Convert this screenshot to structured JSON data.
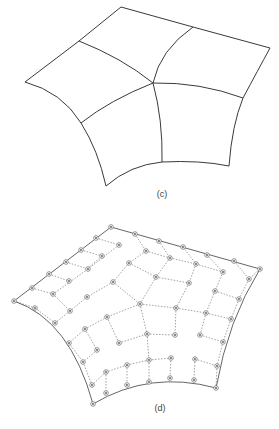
{
  "figures": [
    {
      "id": "c",
      "label": "(c)",
      "label_pos": [
        162,
        189
      ],
      "description": "Subdivision surface of four quadrilateral patches meeting at a central vertex",
      "patch_edges": [
        "M121 7 L193 27",
        "M193 27 L270 48",
        "M121 7 L79 41",
        "M79 41 L25 82",
        "M25 82 Q62 92 81 123",
        "M81 123 Q98 150 106 186",
        "M106 186 Q130 165 162 162",
        "M162 162 Q200 160 229 166",
        "M229 166 Q232 125 243 98",
        "M243 98 Q258 70 270 48",
        "M79 41 Q122 58 153 83",
        "M153 83 Q160 50 193 27",
        "M153 83 Q200 82 243 98",
        "M153 83 Q110 100 81 123",
        "M153 83 Q163 120 162 162"
      ]
    },
    {
      "id": "d",
      "label": "(d)",
      "label_pos": [
        160,
        403
      ],
      "description": "Control net with dotted edges and circular control points",
      "boundary_curves": [
        "M111 227 L260 269",
        "M111 227 L14 301",
        "M14 301 Q70 320 93 404",
        "M93 404 Q150 370 216 388",
        "M216 388 Q228 320 260 269"
      ],
      "net_edges": [
        [
          [
            96,
            238
          ],
          [
            119,
            245
          ]
        ],
        [
          [
            81,
            250
          ],
          [
            102,
            256
          ]
        ],
        [
          [
            66,
            262
          ],
          [
            88,
            269
          ]
        ],
        [
          [
            49,
            274
          ],
          [
            69,
            281
          ]
        ],
        [
          [
            32,
            288
          ],
          [
            53,
            294
          ]
        ],
        [
          [
            14,
            301
          ],
          [
            35,
            308
          ]
        ],
        [
          [
            135,
            234
          ],
          [
            146,
            251
          ]
        ],
        [
          [
            159,
            241
          ],
          [
            170,
            258
          ]
        ],
        [
          [
            183,
            247
          ],
          [
            196,
            264
          ]
        ],
        [
          [
            207,
            255
          ],
          [
            223,
            272
          ]
        ],
        [
          [
            234,
            261
          ],
          [
            249,
            279
          ]
        ],
        [
          [
            260,
            269
          ],
          [
            249,
            279
          ]
        ],
        [
          [
            119,
            245
          ],
          [
            88,
            269
          ]
        ],
        [
          [
            88,
            269
          ],
          [
            53,
            294
          ]
        ],
        [
          [
            146,
            251
          ],
          [
            129,
            263
          ]
        ],
        [
          [
            102,
            256
          ],
          [
            88,
            268
          ]
        ],
        [
          [
            129,
            263
          ],
          [
            113,
            282
          ]
        ],
        [
          [
            113,
            282
          ],
          [
            87,
            297
          ]
        ],
        [
          [
            87,
            297
          ],
          [
            70,
            311
          ]
        ],
        [
          [
            146,
            251
          ],
          [
            170,
            258
          ]
        ],
        [
          [
            170,
            258
          ],
          [
            196,
            264
          ]
        ],
        [
          [
            196,
            264
          ],
          [
            223,
            272
          ]
        ],
        [
          [
            129,
            263
          ],
          [
            156,
            277
          ]
        ],
        [
          [
            156,
            277
          ],
          [
            189,
            283
          ]
        ],
        [
          [
            170,
            258
          ],
          [
            156,
            277
          ]
        ],
        [
          [
            196,
            264
          ],
          [
            189,
            283
          ]
        ],
        [
          [
            113,
            282
          ],
          [
            140,
            304
          ]
        ],
        [
          [
            156,
            277
          ],
          [
            140,
            304
          ]
        ],
        [
          [
            140,
            304
          ],
          [
            176,
            308
          ]
        ],
        [
          [
            176,
            308
          ],
          [
            206,
            313
          ]
        ],
        [
          [
            206,
            313
          ],
          [
            231,
            319
          ]
        ],
        [
          [
            189,
            283
          ],
          [
            176,
            308
          ]
        ],
        [
          [
            223,
            272
          ],
          [
            215,
            291
          ]
        ],
        [
          [
            215,
            291
          ],
          [
            239,
            299
          ]
        ],
        [
          [
            215,
            291
          ],
          [
            206,
            313
          ]
        ],
        [
          [
            249,
            279
          ],
          [
            239,
            299
          ]
        ],
        [
          [
            239,
            299
          ],
          [
            231,
            319
          ]
        ],
        [
          [
            140,
            304
          ],
          [
            107,
            317
          ]
        ],
        [
          [
            107,
            317
          ],
          [
            85,
            329
          ]
        ],
        [
          [
            85,
            329
          ],
          [
            69,
            343
          ]
        ],
        [
          [
            70,
            311
          ],
          [
            55,
            323
          ]
        ],
        [
          [
            35,
            308
          ],
          [
            55,
            323
          ]
        ],
        [
          [
            53,
            294
          ],
          [
            70,
            311
          ]
        ],
        [
          [
            140,
            304
          ],
          [
            147,
            334
          ]
        ],
        [
          [
            107,
            317
          ],
          [
            119,
            343
          ]
        ],
        [
          [
            119,
            343
          ],
          [
            147,
            334
          ]
        ],
        [
          [
            147,
            334
          ],
          [
            175,
            335
          ]
        ],
        [
          [
            176,
            308
          ],
          [
            175,
            335
          ]
        ],
        [
          [
            85,
            329
          ],
          [
            97,
            350
          ]
        ],
        [
          [
            97,
            350
          ],
          [
            83,
            362
          ]
        ],
        [
          [
            69,
            343
          ],
          [
            83,
            362
          ]
        ],
        [
          [
            206,
            313
          ],
          [
            200,
            335
          ]
        ],
        [
          [
            200,
            335
          ],
          [
            223,
            342
          ]
        ],
        [
          [
            231,
            319
          ],
          [
            223,
            342
          ]
        ],
        [
          [
            147,
            334
          ],
          [
            149,
            360
          ]
        ],
        [
          [
            149,
            360
          ],
          [
            127,
            365
          ]
        ],
        [
          [
            149,
            360
          ],
          [
            171,
            358
          ]
        ],
        [
          [
            127,
            365
          ],
          [
            106,
            372
          ]
        ],
        [
          [
            106,
            372
          ],
          [
            92,
            385
          ]
        ],
        [
          [
            83,
            362
          ],
          [
            92,
            385
          ]
        ],
        [
          [
            195,
            359
          ],
          [
            217,
            366
          ]
        ],
        [
          [
            223,
            342
          ],
          [
            217,
            366
          ]
        ],
        [
          [
            127,
            365
          ],
          [
            127,
            385
          ]
        ],
        [
          [
            106,
            372
          ],
          [
            106,
            393
          ]
        ],
        [
          [
            149,
            360
          ],
          [
            149,
            382
          ]
        ],
        [
          [
            171,
            358
          ],
          [
            170,
            378
          ]
        ],
        [
          [
            195,
            359
          ],
          [
            194,
            380
          ]
        ],
        [
          [
            217,
            366
          ],
          [
            216,
            388
          ]
        ]
      ],
      "control_points": [
        [
          111,
          227
        ],
        [
          135,
          234
        ],
        [
          159,
          241
        ],
        [
          183,
          247
        ],
        [
          207,
          255
        ],
        [
          234,
          261
        ],
        [
          260,
          269
        ],
        [
          96,
          238
        ],
        [
          119,
          245
        ],
        [
          146,
          251
        ],
        [
          170,
          258
        ],
        [
          196,
          264
        ],
        [
          223,
          272
        ],
        [
          249,
          279
        ],
        [
          81,
          250
        ],
        [
          102,
          256
        ],
        [
          129,
          263
        ],
        [
          156,
          277
        ],
        [
          189,
          283
        ],
        [
          215,
          291
        ],
        [
          239,
          299
        ],
        [
          66,
          262
        ],
        [
          88,
          269
        ],
        [
          113,
          282
        ],
        [
          140,
          304
        ],
        [
          176,
          308
        ],
        [
          206,
          313
        ],
        [
          231,
          319
        ],
        [
          49,
          274
        ],
        [
          69,
          281
        ],
        [
          87,
          297
        ],
        [
          107,
          317
        ],
        [
          147,
          334
        ],
        [
          175,
          335
        ],
        [
          200,
          335
        ],
        [
          223,
          342
        ],
        [
          32,
          288
        ],
        [
          53,
          294
        ],
        [
          70,
          311
        ],
        [
          85,
          329
        ],
        [
          119,
          343
        ],
        [
          149,
          360
        ],
        [
          171,
          358
        ],
        [
          195,
          359
        ],
        [
          217,
          366
        ],
        [
          14,
          301
        ],
        [
          35,
          308
        ],
        [
          55,
          323
        ],
        [
          69,
          343
        ],
        [
          97,
          350
        ],
        [
          127,
          365
        ],
        [
          149,
          382
        ],
        [
          170,
          378
        ],
        [
          194,
          380
        ],
        [
          216,
          388
        ],
        [
          83,
          362
        ],
        [
          106,
          372
        ],
        [
          92,
          385
        ],
        [
          127,
          385
        ],
        [
          106,
          393
        ],
        [
          93,
          404
        ]
      ]
    }
  ],
  "colors": {
    "background": "#ffffff",
    "surface_line": "#3a3a3a",
    "net_line": "#8a8a8a",
    "control_point": "#777777"
  }
}
